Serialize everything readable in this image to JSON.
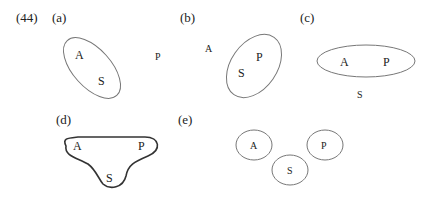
{
  "figure_number": "(44)",
  "panels": [
    {
      "id": "a",
      "label": "(a)",
      "letters": {
        "A": "A",
        "S": "S",
        "P": "P"
      }
    },
    {
      "id": "b",
      "label": "(b)",
      "letters": {
        "A": "A",
        "S": "S",
        "P": "P"
      }
    },
    {
      "id": "c",
      "label": "(c)",
      "letters": {
        "A": "A",
        "S": "S",
        "P": "P"
      }
    },
    {
      "id": "d",
      "label": "(d)",
      "letters": {
        "A": "A",
        "S": "S",
        "P": "P"
      }
    },
    {
      "id": "e",
      "label": "(e)",
      "letters": {
        "A": "A",
        "S": "S",
        "P": "P"
      }
    }
  ],
  "colors": {
    "stroke": "#777777",
    "stroke_bold": "#333333",
    "text": "#222222"
  }
}
